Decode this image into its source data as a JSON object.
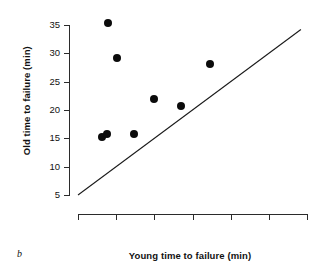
{
  "chart_data": {
    "type": "scatter",
    "title": "",
    "panel_label": "b",
    "xlabel": "Young time to failure (min)",
    "ylabel": "Old time to failure (min)",
    "xlim": [
      5,
      35
    ],
    "ylim": [
      5,
      35
    ],
    "xticks": [
      5,
      10,
      15,
      20,
      25,
      30,
      35
    ],
    "yticks": [
      5,
      10,
      15,
      20,
      25,
      30,
      35
    ],
    "xtick_labels": [
      "5",
      "10",
      "15",
      "20",
      "25",
      "30",
      "35"
    ],
    "ytick_labels": [
      "5",
      "10",
      "15",
      "20",
      "25",
      "30",
      "35"
    ],
    "grid": false,
    "legend": "none",
    "marker_color": "#0b0b0b",
    "axis_color": "#2b2b2b",
    "points": [
      {
        "x": 8.9,
        "y": 35.3
      },
      {
        "x": 10.1,
        "y": 29.2
      },
      {
        "x": 22.3,
        "y": 28.2
      },
      {
        "x": 14.9,
        "y": 21.9
      },
      {
        "x": 18.5,
        "y": 20.7
      },
      {
        "x": 8.2,
        "y": 15.2
      },
      {
        "x": 8.8,
        "y": 15.8
      },
      {
        "x": 12.3,
        "y": 15.8
      }
    ],
    "reference_line": {
      "name": "identity-line",
      "x0": 5,
      "y0": 5,
      "x1": 34.2,
      "y1": 34.2,
      "color": "#1a1a1a"
    }
  }
}
